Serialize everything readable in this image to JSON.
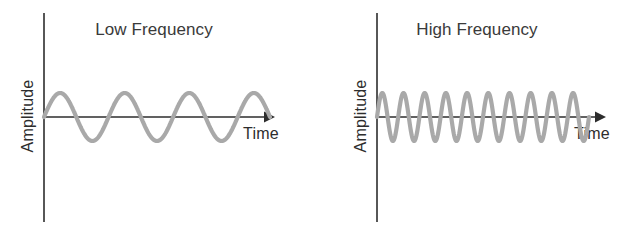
{
  "figure": {
    "background_color": "#ffffff",
    "axis_color": "#2d2d2d",
    "wave_color": "#a9a9a9",
    "text_color": "#3a3a3a",
    "width": 636,
    "height": 241
  },
  "panels": [
    {
      "key": "low",
      "title": "Low Frequency",
      "y_axis_label": "Amplitude",
      "x_axis_label": "Time"
    },
    {
      "key": "high",
      "title": "High Frequency",
      "y_axis_label": "Amplitude",
      "x_axis_label": "Time"
    }
  ],
  "chart_data": [
    {
      "type": "line",
      "title": "Low Frequency",
      "xlabel": "Time",
      "ylabel": "Amplitude",
      "series": [
        {
          "name": "low-frequency sine wave",
          "waveform": "sine",
          "cycles": 3.5,
          "amplitude": 1.0,
          "phase_deg": 0,
          "x_start_px": 44,
          "x_end_px": 270,
          "baseline_y_px": 117,
          "amplitude_px": 24,
          "color": "#a9a9a9"
        }
      ],
      "axes": {
        "x_axis_y_px": 117,
        "x_axis_start_px": 44,
        "x_axis_end_px": 275,
        "x_axis_arrow": true,
        "x_axis_style": "solid",
        "y_axis_x_px": 44,
        "y_axis_top_px": 13,
        "y_axis_bottom_px": 222,
        "ticks": [],
        "tick_labels": [],
        "grid": false
      },
      "legend": null,
      "annotations": []
    },
    {
      "type": "line",
      "title": "High Frequency",
      "xlabel": "Time",
      "ylabel": "Amplitude",
      "series": [
        {
          "name": "high-frequency sine wave",
          "waveform": "sine",
          "cycles": 10,
          "amplitude": 1.0,
          "phase_deg": 0,
          "x_start_px": 59,
          "x_end_px": 271,
          "baseline_y_px": 117,
          "amplitude_px": 24,
          "color": "#a9a9a9"
        }
      ],
      "axes": {
        "x_axis_y_px": 117,
        "x_axis_start_px": 59,
        "x_axis_end_px": 288,
        "x_axis_arrow": true,
        "x_axis_style": "solid",
        "y_axis_x_px": 59,
        "y_axis_top_px": 13,
        "y_axis_bottom_px": 222,
        "ticks": [],
        "tick_labels": [],
        "grid": false
      },
      "legend": null,
      "annotations": []
    }
  ]
}
